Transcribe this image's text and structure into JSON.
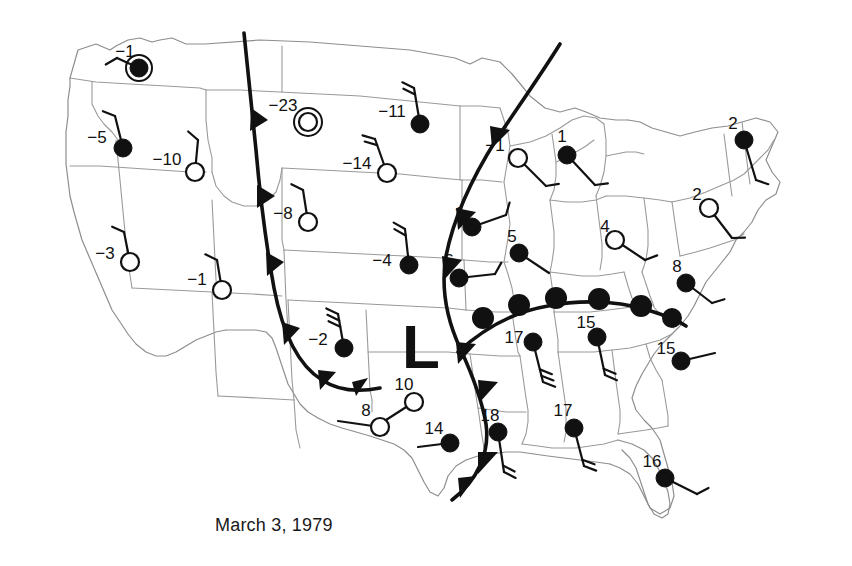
{
  "figure": {
    "caption": "March 3, 1979",
    "low_pressure_label": "L"
  },
  "chart_data": {
    "type": "map",
    "title": "March 3, 1979",
    "subtitle": "",
    "xlabel": "",
    "ylabel": "",
    "legend_position": "none",
    "grid": false,
    "map_region": "Contiguous United States",
    "variable": "Surface temperature (degrees) with station wind barbs",
    "pressure_centers": [
      {
        "type": "low",
        "label": "L",
        "x": 421,
        "y": 345
      }
    ],
    "fronts": [
      {
        "type": "cold",
        "name": "western-cold-front",
        "barb_shape": "triangle",
        "note": "runs south from Canadian border through Montana, Wyoming, Colorado then bends east across New Mexico into Texas panhandle"
      },
      {
        "type": "cold",
        "name": "eastern-cold-front",
        "barb_shape": "triangle",
        "note": "runs south from Minnesota through Iowa and Missouri, south into Louisiana and the Gulf coast"
      },
      {
        "type": "warm",
        "name": "gulf-warm-front",
        "barb_shape": "semicircle",
        "note": "arcs east from Arkansas across Tennessee into North Carolina"
      }
    ],
    "stations": [
      {
        "id": "wa",
        "label": "−1",
        "value": -1,
        "symbol": "filled-ring",
        "x": 139,
        "y": 68,
        "label_x": 125,
        "label_y": 53,
        "wind": {
          "shaft_dx": -22,
          "shaft_dy": -10,
          "feathers": 1
        }
      },
      {
        "id": "or",
        "label": "−5",
        "value": -5,
        "symbol": "filled",
        "x": 123,
        "y": 148,
        "label_x": 97,
        "label_y": 139,
        "wind": {
          "shaft_dx": -8,
          "shaft_dy": -32,
          "feathers": 1
        }
      },
      {
        "id": "id",
        "label": "−10",
        "value": -10,
        "symbol": "open",
        "x": 195,
        "y": 172,
        "label_x": 167,
        "label_y": 161,
        "wind": {
          "shaft_dx": 3,
          "shaft_dy": -32,
          "feathers": 1
        }
      },
      {
        "id": "mt",
        "label": "−23",
        "value": -23,
        "symbol": "double-open",
        "x": 308,
        "y": 122,
        "label_x": 283,
        "label_y": 107,
        "wind": null
      },
      {
        "id": "nd",
        "label": "−11",
        "value": -11,
        "symbol": "filled",
        "x": 420,
        "y": 124,
        "label_x": 392,
        "label_y": 113,
        "wind": {
          "shaft_dx": -6,
          "shaft_dy": -36,
          "feathers": 2
        }
      },
      {
        "id": "sd",
        "label": "−14",
        "value": -14,
        "symbol": "open",
        "x": 387,
        "y": 173,
        "label_x": 357,
        "label_y": 165,
        "wind": {
          "shaft_dx": -12,
          "shaft_dy": -34,
          "feathers": 2
        }
      },
      {
        "id": "ut",
        "label": "−8",
        "value": -8,
        "symbol": "open",
        "x": 308,
        "y": 222,
        "label_x": 283,
        "label_y": 215,
        "wind": {
          "shaft_dx": -5,
          "shaft_dy": -32,
          "feathers": 1
        }
      },
      {
        "id": "nv",
        "label": "−3",
        "value": -3,
        "symbol": "open",
        "x": 130,
        "y": 262,
        "label_x": 105,
        "label_y": 255,
        "wind": {
          "shaft_dx": -6,
          "shaft_dy": -30,
          "feathers": 1
        }
      },
      {
        "id": "az",
        "label": "−1",
        "value": -1,
        "symbol": "open",
        "x": 222,
        "y": 290,
        "label_x": 197,
        "label_y": 281,
        "wind": {
          "shaft_dx": -5,
          "shaft_dy": -30,
          "feathers": 1
        }
      },
      {
        "id": "nm",
        "label": "−2",
        "value": -2,
        "symbol": "filled",
        "x": 344,
        "y": 348,
        "label_x": 318,
        "label_y": 341,
        "wind": {
          "shaft_dx": -6,
          "shaft_dy": -34,
          "feathers": 3
        }
      },
      {
        "id": "ne",
        "label": "−4",
        "value": -4,
        "symbol": "filled",
        "x": 409,
        "y": 265,
        "label_x": 382,
        "label_y": 262,
        "wind": {
          "shaft_dx": -4,
          "shaft_dy": -36,
          "feathers": 2
        }
      },
      {
        "id": "mn",
        "label": "−1",
        "value": -1,
        "symbol": "open",
        "x": 518,
        "y": 158,
        "label_x": 495,
        "label_y": 147,
        "wind": {
          "shaft_dx": 28,
          "shaft_dy": 28,
          "feathers": 1
        }
      },
      {
        "id": "mi",
        "label": "1",
        "value": 1,
        "symbol": "filled",
        "x": 567,
        "y": 155,
        "label_x": 562,
        "label_y": 138,
        "wind": {
          "shaft_dx": 28,
          "shaft_dy": 30,
          "feathers": 1
        }
      },
      {
        "id": "ia",
        "label": "1",
        "value": 1,
        "symbol": "filled",
        "x": 472,
        "y": 227,
        "label_x": 459,
        "label_y": 215,
        "wind": {
          "shaft_dx": 34,
          "shaft_dy": -12,
          "feathers": 1
        }
      },
      {
        "id": "il",
        "label": "5",
        "value": 5,
        "symbol": "filled",
        "x": 519,
        "y": 253,
        "label_x": 512,
        "label_y": 238,
        "wind": {
          "shaft_dx": 30,
          "shaft_dy": 20,
          "feathers": 0
        }
      },
      {
        "id": "ks",
        "label": "6",
        "value": 6,
        "symbol": "filled",
        "x": 459,
        "y": 278,
        "label_x": 449,
        "label_y": 262,
        "wind": {
          "shaft_dx": 36,
          "shaft_dy": -4,
          "feathers": 1
        }
      },
      {
        "id": "oh",
        "label": "4",
        "value": 4,
        "symbol": "open",
        "x": 615,
        "y": 240,
        "label_x": 605,
        "label_y": 228,
        "wind": {
          "shaft_dx": 30,
          "shaft_dy": 20,
          "feathers": 1
        }
      },
      {
        "id": "pa",
        "label": "2",
        "value": 2,
        "symbol": "open",
        "x": 709,
        "y": 208,
        "label_x": 697,
        "label_y": 196,
        "wind": {
          "shaft_dx": 23,
          "shaft_dy": 30,
          "feathers": 1
        }
      },
      {
        "id": "vt",
        "label": "2",
        "value": 2,
        "symbol": "filled",
        "x": 744,
        "y": 140,
        "label_x": 733,
        "label_y": 125,
        "wind": {
          "shaft_dx": 12,
          "shaft_dy": 40,
          "feathers": 1
        }
      },
      {
        "id": "va",
        "label": "8",
        "value": 8,
        "symbol": "filled",
        "x": 686,
        "y": 283,
        "label_x": 677,
        "label_y": 268,
        "wind": {
          "shaft_dx": 26,
          "shaft_dy": 20,
          "feathers": 1
        }
      },
      {
        "id": "tn",
        "label": "17",
        "value": 17,
        "symbol": "filled",
        "x": 533,
        "y": 342,
        "label_x": 514,
        "label_y": 339,
        "wind": {
          "shaft_dx": 10,
          "shaft_dy": 40,
          "feathers": 3
        }
      },
      {
        "id": "ky",
        "label": "15",
        "value": 15,
        "symbol": "filled",
        "x": 597,
        "y": 337,
        "label_x": 586,
        "label_y": 324,
        "wind": {
          "shaft_dx": 8,
          "shaft_dy": 38,
          "feathers": 2
        }
      },
      {
        "id": "sc",
        "label": "15",
        "value": 15,
        "symbol": "filled",
        "x": 681,
        "y": 361,
        "label_x": 666,
        "label_y": 350,
        "wind": {
          "shaft_dx": 34,
          "shaft_dy": -8,
          "feathers": 0
        }
      },
      {
        "id": "tx-n",
        "label": "10",
        "value": 10,
        "symbol": "open",
        "x": 414,
        "y": 402,
        "label_x": 404,
        "label_y": 386,
        "wind": {
          "shaft_dx": -28,
          "shaft_dy": 18,
          "feathers": 0
        }
      },
      {
        "id": "tx-w",
        "label": "8",
        "value": 8,
        "symbol": "open",
        "x": 380,
        "y": 427,
        "label_x": 366,
        "label_y": 412,
        "wind": {
          "shaft_dx": -42,
          "shaft_dy": -6,
          "feathers": 0
        }
      },
      {
        "id": "tx-s",
        "label": "14",
        "value": 14,
        "symbol": "filled",
        "x": 450,
        "y": 443,
        "label_x": 434,
        "label_y": 430,
        "wind": {
          "shaft_dx": -32,
          "shaft_dy": 4,
          "feathers": 0
        }
      },
      {
        "id": "la",
        "label": "18",
        "value": 18,
        "symbol": "filled",
        "x": 498,
        "y": 432,
        "label_x": 490,
        "label_y": 417,
        "wind": {
          "shaft_dx": 6,
          "shaft_dy": 40,
          "feathers": 2
        }
      },
      {
        "id": "al",
        "label": "17",
        "value": 17,
        "symbol": "filled",
        "x": 574,
        "y": 428,
        "label_x": 563,
        "label_y": 412,
        "wind": {
          "shaft_dx": 10,
          "shaft_dy": 38,
          "feathers": 2
        }
      },
      {
        "id": "fl",
        "label": "16",
        "value": 16,
        "symbol": "filled",
        "x": 665,
        "y": 478,
        "label_x": 652,
        "label_y": 463,
        "wind": {
          "shaft_dx": 32,
          "shaft_dy": 16,
          "feathers": 1
        }
      }
    ]
  },
  "colors": {
    "background": "#ffffff",
    "state_border": "#9a9a9a",
    "front": "#111111",
    "station": "#111111",
    "text": "#1a1a1a"
  }
}
